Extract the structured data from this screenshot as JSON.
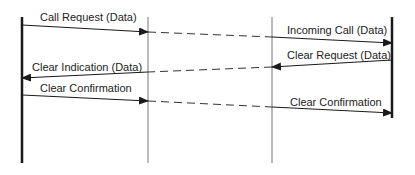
{
  "diagram": {
    "type": "sequence-diagram",
    "colors": {
      "background": "#ffffff",
      "line": "#1a1a1a",
      "thin_line": "#777777",
      "text": "#222222"
    },
    "lifelines": [
      {
        "id": "dte-a",
        "x": 22,
        "y1": 17,
        "y2": 163,
        "style": "thick"
      },
      {
        "id": "dce-a",
        "x": 148,
        "y1": 17,
        "y2": 163,
        "style": "thin"
      },
      {
        "id": "dce-b",
        "x": 272,
        "y1": 17,
        "y2": 163,
        "style": "thin"
      },
      {
        "id": "dte-b",
        "x": 392,
        "y1": 17,
        "y2": 118,
        "style": "thick"
      }
    ],
    "messages": [
      {
        "label": "Call Request (Data)",
        "direction": "right",
        "from": "dte-a",
        "to": "dce-a",
        "segment": "solid"
      },
      {
        "label": "",
        "direction": "right",
        "from": "dce-a",
        "to": "dce-b",
        "segment": "dashed"
      },
      {
        "label": "Incoming Call (Data)",
        "direction": "right",
        "from": "dce-b",
        "to": "dte-b",
        "segment": "solid"
      },
      {
        "label": "Clear Request (Data)",
        "direction": "left",
        "from": "dte-b",
        "to": "dce-b",
        "segment": "solid"
      },
      {
        "label": "",
        "direction": "left",
        "from": "dce-b",
        "to": "dce-a",
        "segment": "dashed"
      },
      {
        "label": "Clear Indication (Data)",
        "direction": "left",
        "from": "dce-a",
        "to": "dte-a",
        "segment": "solid"
      },
      {
        "label": "Clear Confirmation",
        "direction": "right",
        "from": "dte-a",
        "to": "dce-a",
        "segment": "solid"
      },
      {
        "label": "",
        "direction": "right",
        "from": "dce-a",
        "to": "dce-b",
        "segment": "dashed"
      },
      {
        "label": "Clear Confirmation",
        "direction": "right",
        "from": "dce-b",
        "to": "dte-b",
        "segment": "solid"
      }
    ]
  },
  "labels": {
    "call_request": "Call Request (Data)",
    "incoming_call": "Incoming Call (Data)",
    "clear_request": "Clear Request (Data)",
    "clear_indication": "Clear Indication (Data)",
    "clear_confirmation_left": "Clear Confirmation",
    "clear_confirmation_right": "Clear Confirmation"
  }
}
